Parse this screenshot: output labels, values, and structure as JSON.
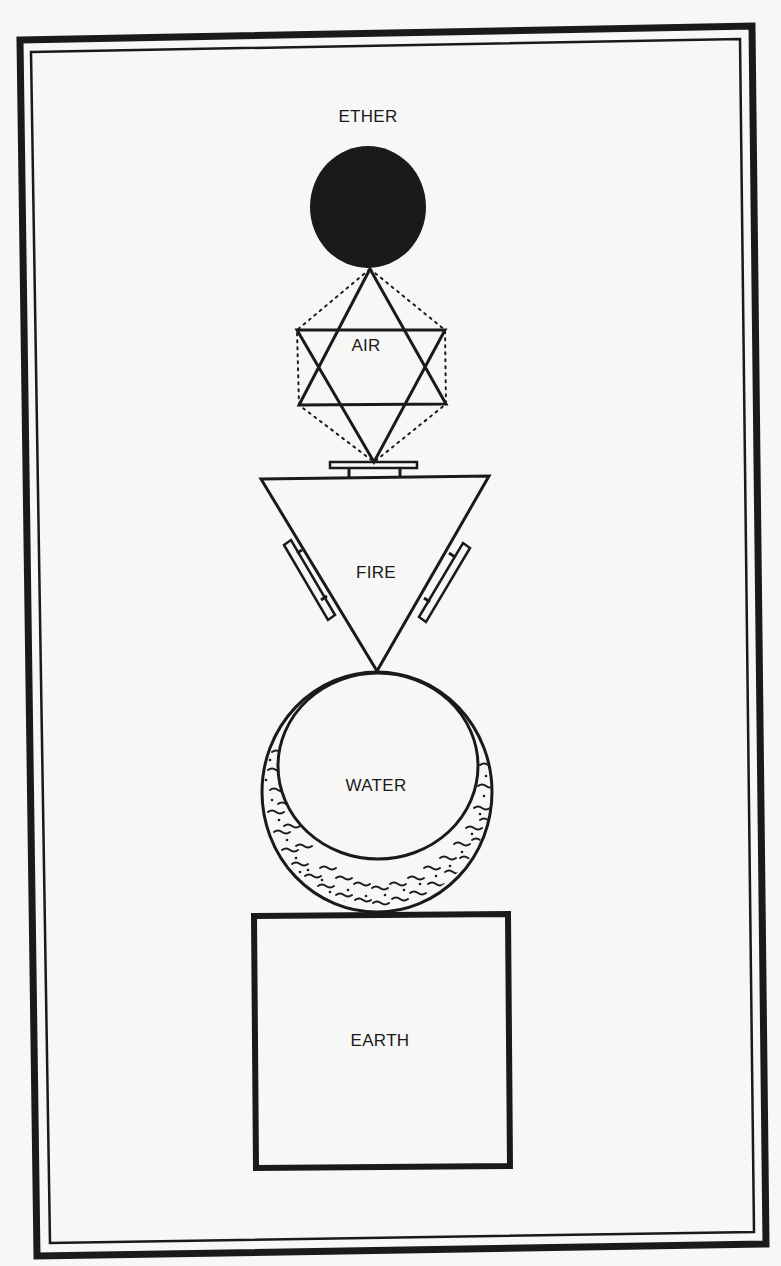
{
  "diagram": {
    "type": "element-hierarchy",
    "orientation": "vertical",
    "colors": {
      "background": "#f7f7f5",
      "ink": "#1a1a1a"
    },
    "frame": {
      "style": "double-border"
    },
    "elements": [
      {
        "id": "ether",
        "label": "ETHER",
        "shape": "filled-circle",
        "order": 1
      },
      {
        "id": "air",
        "label": "AIR",
        "shape": "hexagram-with-dotted-hexagon",
        "order": 2
      },
      {
        "id": "fire",
        "label": "FIRE",
        "shape": "downward-triangle-with-side-bars",
        "order": 3
      },
      {
        "id": "water",
        "label": "WATER",
        "shape": "circle-with-wavy-crescent",
        "order": 4
      },
      {
        "id": "earth",
        "label": "EARTH",
        "shape": "square",
        "order": 5
      }
    ]
  }
}
